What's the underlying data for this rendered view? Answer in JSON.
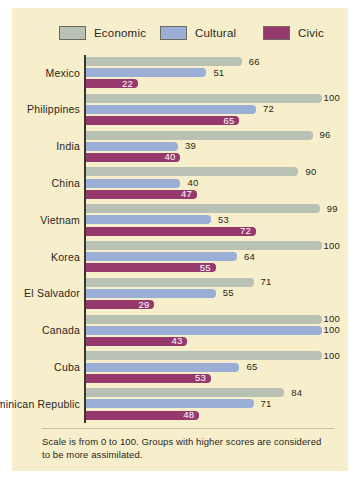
{
  "legend": {
    "items": [
      {
        "label": "Economic",
        "color": "#b9c0b4",
        "key": "economic"
      },
      {
        "label": "Cultural",
        "color": "#9aaed6",
        "key": "cultural"
      },
      {
        "label": "Civic",
        "color": "#963a6d",
        "key": "civic"
      }
    ]
  },
  "footnote": "Scale is from 0 to 100. Groups with higher scores are considered to be more assimilated.",
  "chart_data": {
    "type": "bar",
    "orientation": "horizontal",
    "title": "",
    "xlabel": "",
    "ylabel": "",
    "xlim": [
      0,
      100
    ],
    "grid": false,
    "legend_position": "top",
    "categories": [
      "Mexico",
      "Philippines",
      "India",
      "China",
      "Vietnam",
      "Korea",
      "El Salvador",
      "Canada",
      "Cuba",
      "Dominican Republic"
    ],
    "series": [
      {
        "name": "Economic",
        "color": "#b9c0b4",
        "values": [
          66,
          100,
          96,
          90,
          99,
          100,
          71,
          100,
          100,
          84
        ]
      },
      {
        "name": "Cultural",
        "color": "#9aaed6",
        "values": [
          51,
          72,
          39,
          40,
          53,
          64,
          55,
          100,
          65,
          71
        ]
      },
      {
        "name": "Civic",
        "color": "#963a6d",
        "values": [
          22,
          65,
          40,
          47,
          72,
          55,
          29,
          43,
          53,
          48
        ]
      }
    ],
    "annotations": [
      "Scale is from 0 to 100. Groups with higher scores are considered to be more assimilated."
    ]
  }
}
